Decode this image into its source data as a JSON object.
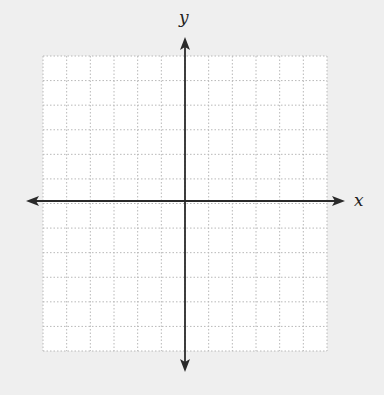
{
  "diagram": {
    "type": "coordinate-plane",
    "x_axis_label": "x",
    "y_axis_label": "y",
    "grid": {
      "columns": 12,
      "rows": 12,
      "left": 43,
      "right": 327,
      "top": 56,
      "bottom": 351,
      "line_style": "dotted",
      "line_color": "#b8b8b8",
      "fill": "#ffffff"
    },
    "axes": {
      "origin_x": 185,
      "origin_y": 201,
      "x_start": 26,
      "x_end": 345,
      "y_start": 37,
      "y_end": 372,
      "color": "#2a2a2a",
      "arrows": "both-ends"
    },
    "background": "#efefef"
  }
}
